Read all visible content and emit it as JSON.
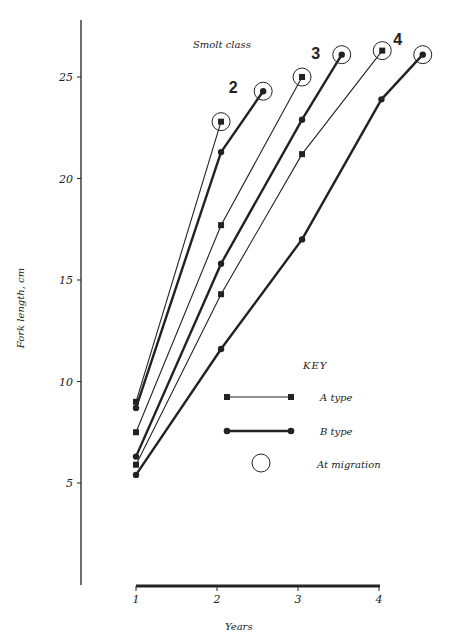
{
  "chart_data": {
    "type": "line",
    "title": "",
    "subtitle": "Smolt class",
    "xlabel": "Years",
    "ylabel": "Fork length, cm",
    "xlim": [
      1,
      4.6
    ],
    "ylim": [
      0,
      27.8
    ],
    "x_ticks": [
      1,
      2,
      3,
      4
    ],
    "y_ticks": [
      5,
      10,
      15,
      20,
      25
    ],
    "grid": false,
    "legend": {
      "title": "KEY",
      "position": "lower right",
      "entries": [
        {
          "label": "A type",
          "marker": "square",
          "line": "thin"
        },
        {
          "label": "B type",
          "marker": "circle",
          "line": "thick"
        },
        {
          "label": "At migration",
          "marker": "open-circle"
        }
      ]
    },
    "series": [
      {
        "name": "Class 2 A type",
        "smolt_class": 2,
        "type": "A",
        "x": [
          1,
          2.05
        ],
        "y": [
          9.0,
          22.8
        ],
        "migration_index": 1
      },
      {
        "name": "Class 2 B type",
        "smolt_class": 2,
        "type": "B",
        "x": [
          1,
          2.05,
          2.57
        ],
        "y": [
          8.7,
          21.3,
          24.3
        ],
        "migration_index": 2
      },
      {
        "name": "Class 3 A type",
        "smolt_class": 3,
        "type": "A",
        "x": [
          1,
          2.05,
          3.05
        ],
        "y": [
          7.5,
          17.7,
          25.0
        ],
        "migration_index": 2
      },
      {
        "name": "Class 3 B type",
        "smolt_class": 3,
        "type": "B",
        "x": [
          1,
          2.05,
          3.05,
          3.54
        ],
        "y": [
          6.3,
          15.8,
          22.9,
          26.1
        ],
        "migration_index": 3
      },
      {
        "name": "Class 4 A type",
        "smolt_class": 4,
        "type": "A",
        "x": [
          1,
          2.05,
          3.05,
          4.04
        ],
        "y": [
          5.9,
          14.3,
          21.2,
          26.3
        ],
        "migration_index": 3
      },
      {
        "name": "Class 4 B type",
        "smolt_class": 4,
        "type": "B",
        "x": [
          1,
          2.05,
          3.05,
          4.03,
          4.54
        ],
        "y": [
          5.4,
          11.6,
          17.0,
          23.9,
          26.1
        ],
        "migration_index": 4
      }
    ],
    "annotations": [
      {
        "text": "2",
        "x": 2.2,
        "y": 24.2
      },
      {
        "text": "3",
        "x": 3.22,
        "y": 25.9
      },
      {
        "text": "4",
        "x": 4.23,
        "y": 26.6
      }
    ]
  },
  "layout": {
    "x_px": {
      "v1": 136,
      "per_unit": 81
    },
    "y_px": {
      "v25": 77,
      "per_unit": 20.3
    },
    "y_axis": {
      "x": 81,
      "top": 20,
      "bottom": 585
    },
    "x_axis": {
      "y": 586,
      "left": 136,
      "right": 380
    },
    "colors": {
      "ink": "#222222",
      "background": "#ffffff"
    }
  }
}
